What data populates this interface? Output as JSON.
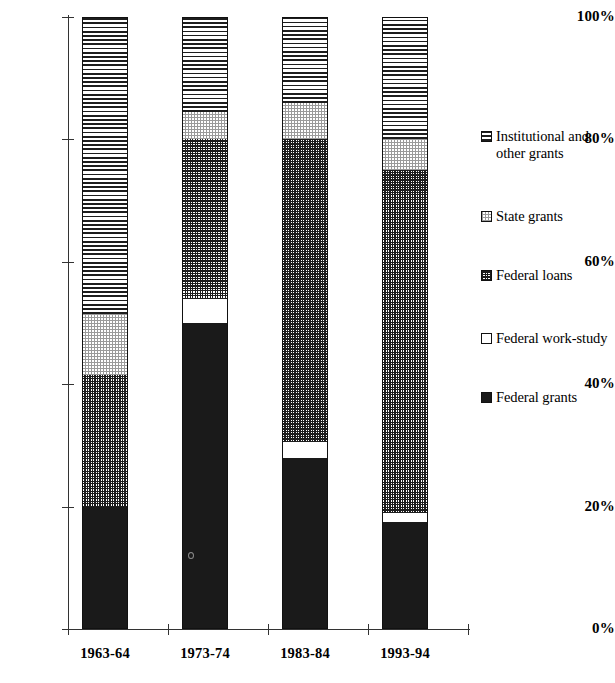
{
  "chart_data": {
    "type": "bar",
    "subtype": "stacked-percentage",
    "title": "",
    "xlabel": "",
    "ylabel": "",
    "ylim": [
      0,
      100
    ],
    "yticks": [
      "0%",
      "20%",
      "40%",
      "60%",
      "80%",
      "100%"
    ],
    "ytick_values": [
      0,
      20,
      40,
      60,
      80,
      100
    ],
    "grid": false,
    "legend_position": "right",
    "categories": [
      "1963-64",
      "1973-74",
      "1983-84",
      "1993-94"
    ],
    "series": [
      {
        "name": "Federal grants",
        "pattern": "solid-black",
        "color": "#1a1a1a",
        "values": [
          20.0,
          50.0,
          28.0,
          17.5
        ]
      },
      {
        "name": "Federal work-study",
        "pattern": "solid-white",
        "color": "#ffffff",
        "values": [
          0.0,
          4.0,
          2.5,
          1.5
        ]
      },
      {
        "name": "Federal loans",
        "pattern": "fine-crosshatch",
        "color": "#1d1d1d",
        "values": [
          21.5,
          26.0,
          49.5,
          56.0
        ]
      },
      {
        "name": "State grants",
        "pattern": "light-dotted-grid",
        "color": "#9a9a9a",
        "values": [
          10.0,
          4.5,
          6.0,
          5.0
        ]
      },
      {
        "name": "Institutional and other grants",
        "pattern": "horizontal-lines",
        "color": "#1d1d1d",
        "values": [
          48.5,
          15.5,
          14.0,
          20.0
        ]
      }
    ]
  },
  "legend": {
    "items": [
      {
        "label": "Institutional and other grants",
        "key": "institutional-and-other-grants"
      },
      {
        "label": "State grants",
        "key": "state-grants"
      },
      {
        "label": "Federal loans",
        "key": "federal-loans"
      },
      {
        "label": "Federal work-study",
        "key": "federal-work-study"
      },
      {
        "label": "Federal grants",
        "key": "federal-grants"
      }
    ]
  }
}
